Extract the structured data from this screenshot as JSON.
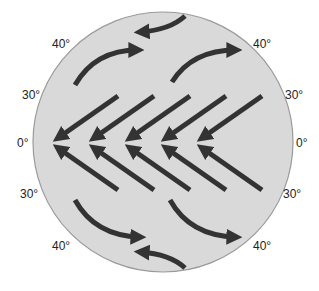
{
  "diagram": {
    "type": "global-wind-circulation",
    "colors": {
      "globe_fill": "#d9d9d9",
      "globe_stroke": "#9a9a9a",
      "arrow": "#333333",
      "label": "#222222",
      "background": "#ffffff"
    },
    "labels": {
      "left_north_40": "40°",
      "left_north_30": "30°",
      "left_equator": "0°",
      "left_south_30": "30°",
      "left_south_40": "40°",
      "right_north_40": "40°",
      "right_north_30": "30°",
      "right_equator": "0°",
      "right_south_30": "30°",
      "right_south_40": "40°"
    },
    "arrows": {
      "trade_winds_northern": [
        {
          "from": [
            118,
            96
          ],
          "to": [
            58,
            138
          ]
        },
        {
          "from": [
            154,
            96
          ],
          "to": [
            94,
            138
          ]
        },
        {
          "from": [
            190,
            96
          ],
          "to": [
            130,
            138
          ]
        },
        {
          "from": [
            226,
            96
          ],
          "to": [
            166,
            138
          ]
        },
        {
          "from": [
            262,
            96
          ],
          "to": [
            202,
            138
          ]
        }
      ],
      "trade_winds_southern": [
        {
          "from": [
            118,
            190
          ],
          "to": [
            58,
            148
          ]
        },
        {
          "from": [
            154,
            190
          ],
          "to": [
            94,
            148
          ]
        },
        {
          "from": [
            190,
            190
          ],
          "to": [
            130,
            148
          ]
        },
        {
          "from": [
            226,
            190
          ],
          "to": [
            166,
            148
          ]
        },
        {
          "from": [
            262,
            190
          ],
          "to": [
            202,
            148
          ]
        }
      ],
      "westerlies_northern": [
        {
          "path": "M75 85 Q95 50 138 50"
        },
        {
          "path": "M172 82 Q192 50 236 50"
        }
      ],
      "westerlies_southern": [
        {
          "path": "M75 200 Q95 236 140 237"
        },
        {
          "path": "M170 200 Q190 236 236 237"
        }
      ],
      "polar_easterlies": [
        {
          "path": "M185 16 Q170 30 140 32",
          "position": "north"
        },
        {
          "path": "M185 268 Q170 254 140 252",
          "position": "south"
        }
      ]
    }
  }
}
